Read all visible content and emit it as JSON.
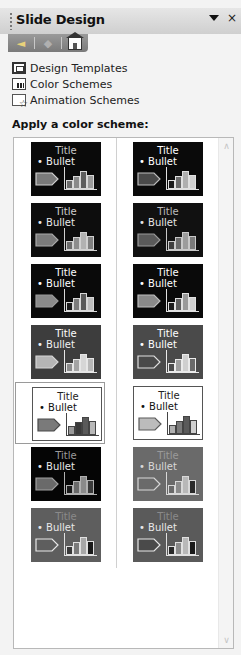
{
  "pane": {
    "title": "Slide Design",
    "dropdown_glyph": "▼",
    "close_glyph": "×"
  },
  "nav": {
    "back_glyph": "◄",
    "forward_glyph": "◆"
  },
  "links": [
    {
      "label": "Design Templates",
      "icon": "design-templates-icon"
    },
    {
      "label": "Color Schemes",
      "icon": "color-schemes-icon"
    },
    {
      "label": "Animation Schemes",
      "icon": "animation-schemes-icon"
    }
  ],
  "section_label": "Apply a color scheme:",
  "scroll": {
    "up_glyph": "∧",
    "down_glyph": "∨"
  },
  "schemes": [
    {
      "title": "Title",
      "bullet": "• Bullet",
      "bg": "#0a0a0a",
      "title_color": "#c8c8c8",
      "text_color": "#f0f0f0",
      "arrow_fill": "#7a7a7a",
      "arrow_stroke": "#cfcfcf",
      "bars": [
        "#6c6c6c",
        "#8a8a8a",
        "#5e5e5e",
        "#9a9a9a"
      ],
      "line": "#d8d8d8",
      "selected": false
    },
    {
      "title": "Title",
      "bullet": "• Bullet",
      "bg": "#0a0a0a",
      "title_color": "#ffffff",
      "text_color": "#ffffff",
      "arrow_fill": "#4a4a4a",
      "arrow_stroke": "#bdbdbd",
      "bars": [
        "#1a1a1a",
        "#6a6a6a",
        "#b0b0b0",
        "#d0d0d0"
      ],
      "line": "#e0e0e0",
      "selected": false
    },
    {
      "title": "Title",
      "bullet": "• Bullet",
      "bg": "#0d0d0d",
      "title_color": "#d0d0d0",
      "text_color": "#e8e8e8",
      "arrow_fill": "#7b7b7b",
      "arrow_stroke": "#a9a9a9",
      "bars": [
        "#6d6d6d",
        "#8d8d8d",
        "#b2b2b2",
        "#808080"
      ],
      "line": "#d0d0d0",
      "selected": false
    },
    {
      "title": "Title",
      "bullet": "• Bullet",
      "bg": "#111111",
      "title_color": "#bdbdbd",
      "text_color": "#e6e6e6",
      "arrow_fill": "#5a5a5a",
      "arrow_stroke": "#9a9a9a",
      "bars": [
        "#3e3e3e",
        "#6a6a6a",
        "#9c9c9c",
        "#7a7a7a"
      ],
      "line": "#c8c8c8",
      "selected": false
    },
    {
      "title": "Title",
      "bullet": "• Bullet",
      "bg": "#0a0a0a",
      "title_color": "#ffffff",
      "text_color": "#ffffff",
      "arrow_fill": "#8a8a8a",
      "arrow_stroke": "#9a9a9a",
      "bars": [
        "#1a1a1a",
        "#7c7c7c",
        "#5a5a5a",
        "#bdbdbd"
      ],
      "line": "#d8d8d8",
      "selected": false
    },
    {
      "title": "Title",
      "bullet": "• Bullet",
      "bg": "#0a0a0a",
      "title_color": "#ffffff",
      "text_color": "#ffffff",
      "arrow_fill": "#8a8a8a",
      "arrow_stroke": "#bdbdbd",
      "bars": [
        "#1c1c1c",
        "#5d5d5d",
        "#9a9a9a",
        "#cfcfcf"
      ],
      "line": "#e0e0e0",
      "selected": false
    },
    {
      "title": "Title",
      "bullet": "• Bullet",
      "bg": "#3d3d3d",
      "title_color": "#ffffff",
      "text_color": "#f2f2f2",
      "arrow_fill": "#b5b5b5",
      "arrow_stroke": "#d5d5d5",
      "bars": [
        "#8c8c8c",
        "#a4a4a4",
        "#d6d6d6",
        "#b8b8b8"
      ],
      "line": "#e6e6e6",
      "selected": false
    },
    {
      "title": "Title",
      "bullet": "• Bullet",
      "bg": "#4a4a4a",
      "title_color": "#ffffff",
      "text_color": "#ffffff",
      "arrow_fill": "#4a4a4a",
      "arrow_stroke": "#e0e0e0",
      "bars": [
        "#4a4a4a",
        "#9c9c9c",
        "#cfcfcf",
        "#6a6a6a"
      ],
      "line": "#eaeaea",
      "selected": false
    },
    {
      "title": "Title",
      "bullet": "• Bullet",
      "bg": "#ffffff",
      "title_color": "#222222",
      "text_color": "#111111",
      "arrow_fill": "#7a7a7a",
      "arrow_stroke": "#4a4a4a",
      "bars": [
        "#9a9a9a",
        "#3a3a3a",
        "#5a5a5a",
        "#b8b8b8"
      ],
      "line": "#444444",
      "selected": true
    },
    {
      "title": "Title",
      "bullet": "• Bullet",
      "bg": "#ffffff",
      "title_color": "#222222",
      "text_color": "#111111",
      "arrow_fill": "#bcbcbc",
      "arrow_stroke": "#5a5a5a",
      "bars": [
        "#b0b0b0",
        "#7a7a7a",
        "#5a5a5a",
        "#d0d0d0"
      ],
      "line": "#444444",
      "selected": false
    },
    {
      "title": "Title",
      "bullet": "• Bullet",
      "bg": "#050505",
      "title_color": "#9a9a9a",
      "text_color": "#e8e8e8",
      "arrow_fill": "#6a6a6a",
      "arrow_stroke": "#a0a0a0",
      "bars": [
        "#1a1a1a",
        "#6a6a6a",
        "#8a8a8a",
        "#3a3a3a"
      ],
      "line": "#b0b0b0",
      "selected": false
    },
    {
      "title": "Title",
      "bullet": "• Bullet",
      "bg": "#6a6a6a",
      "title_color": "#9a9a9a",
      "text_color": "#d8d8d8",
      "arrow_fill": "#6a6a6a",
      "arrow_stroke": "#d8d8d8",
      "bars": [
        "#6a6a6a",
        "#8a8a8a",
        "#b8b8b8",
        "#2a2a2a"
      ],
      "line": "#d8d8d8",
      "selected": false
    },
    {
      "title": "Title",
      "bullet": "• Bullet",
      "bg": "#5e5e5e",
      "title_color": "#8a8a8a",
      "text_color": "#e8e8e8",
      "arrow_fill": "#5e5e5e",
      "arrow_stroke": "#e8e8e8",
      "bars": [
        "#3a3a3a",
        "#7a7a7a",
        "#a8a8a8",
        "#1a1a1a"
      ],
      "line": "#e0e0e0",
      "selected": false
    },
    {
      "title": "Title",
      "bullet": "• Bullet",
      "bg": "#5a5a5a",
      "title_color": "#8a8a8a",
      "text_color": "#e8e8e8",
      "arrow_fill": "#4a4a4a",
      "arrow_stroke": "#e8e8e8",
      "bars": [
        "#2a2a2a",
        "#8a8a8a",
        "#b8b8b8",
        "#1a1a1a"
      ],
      "line": "#e0e0e0",
      "selected": false
    }
  ]
}
